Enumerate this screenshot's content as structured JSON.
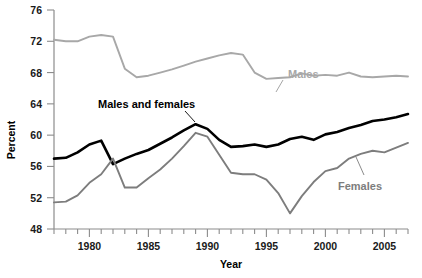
{
  "chart_data": {
    "type": "line",
    "title": "",
    "xlabel": "Year",
    "ylabel": "Percent",
    "xlim": [
      1977,
      2007
    ],
    "ylim": [
      48,
      76
    ],
    "grid": false,
    "legend_position": "inline-annotations",
    "y_ticks": [
      48,
      52,
      56,
      60,
      64,
      68,
      72,
      76
    ],
    "y_tick_labels": [
      "48",
      "52",
      "56",
      "60",
      "64",
      "68",
      "72",
      "76"
    ],
    "x_ticks": [
      1980,
      1985,
      1990,
      1995,
      2000,
      2005
    ],
    "x_tick_labels": [
      "1980",
      "1985",
      "1990",
      "1995",
      "2000",
      "2005"
    ],
    "x_minor_tick_interval": 1,
    "x": [
      1977,
      1978,
      1979,
      1980,
      1981,
      1982,
      1983,
      1984,
      1985,
      1986,
      1987,
      1988,
      1989,
      1990,
      1991,
      1992,
      1993,
      1994,
      1995,
      1996,
      1997,
      1998,
      1999,
      2000,
      2001,
      2002,
      2003,
      2004,
      2005,
      2006,
      2007
    ],
    "series": [
      {
        "name": "Males",
        "color": "#a8a8a8",
        "label_text": "Males",
        "values": [
          72.2,
          72.0,
          72.0,
          72.6,
          72.8,
          72.6,
          68.5,
          67.4,
          67.6,
          68.0,
          68.4,
          68.9,
          69.4,
          69.8,
          70.2,
          70.5,
          70.3,
          68.0,
          67.2,
          67.3,
          67.4,
          67.9,
          67.6,
          67.7,
          67.6,
          68.0,
          67.5,
          67.4,
          67.5,
          67.6,
          67.5
        ]
      },
      {
        "name": "Males and females",
        "color": "#000000",
        "label_text": "Males and females",
        "values": [
          57.0,
          57.1,
          57.8,
          58.8,
          59.3,
          56.3,
          57.0,
          57.6,
          58.1,
          58.9,
          59.7,
          60.6,
          61.4,
          60.8,
          59.4,
          58.5,
          58.6,
          58.8,
          58.5,
          58.8,
          59.5,
          59.8,
          59.4,
          60.1,
          60.4,
          60.9,
          61.3,
          61.8,
          62.0,
          62.3,
          62.7
        ]
      },
      {
        "name": "Females",
        "color": "#7d7d7d",
        "label_text": "Females",
        "values": [
          51.4,
          51.5,
          52.3,
          53.9,
          55.0,
          57.0,
          53.3,
          53.3,
          54.5,
          55.6,
          57.0,
          58.6,
          60.3,
          59.8,
          57.5,
          55.2,
          55.0,
          55.0,
          54.3,
          52.6,
          50.0,
          52.2,
          54.0,
          55.4,
          55.8,
          57.0,
          57.6,
          58.0,
          57.8,
          58.4,
          59.0
        ]
      }
    ],
    "annotations": [
      {
        "text": "Males",
        "x": 1995.0,
        "y": 70.5
      },
      {
        "text": "Males and females",
        "x": 1984.5,
        "y": 64.6
      },
      {
        "text": "Females",
        "x": 2001.0,
        "y": 53.0
      }
    ]
  },
  "a11y": {
    "chart_role": "line chart",
    "description_label": "Percent by Year"
  }
}
